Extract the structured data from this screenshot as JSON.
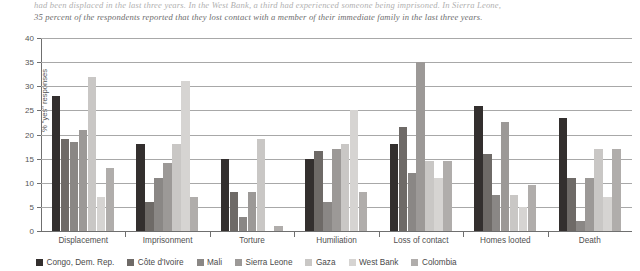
{
  "caption": {
    "line1": "had been displaced in the last three years. In the West Bank, a third had experienced someone being imprisoned. In Sierra Leone,",
    "line2": "35 percent of the respondents reported that they lost contact with a member of their immediate family in the last three years."
  },
  "chart_data": {
    "type": "bar",
    "title": "",
    "xlabel": "",
    "ylabel": "% \"yes\" responses",
    "ylim": [
      0,
      40
    ],
    "yticks": [
      0,
      5,
      10,
      15,
      20,
      25,
      30,
      35,
      40
    ],
    "grid": true,
    "legend_position": "bottom",
    "categories": [
      "Displacement",
      "Imprisonment",
      "Torture",
      "Humiliation",
      "Loss of contact",
      "Homes looted",
      "Death"
    ],
    "series": [
      {
        "name": "Congo, Dem. Rep.",
        "color": "#332f2e",
        "values": [
          28,
          18,
          15,
          15,
          18,
          26,
          23.5
        ]
      },
      {
        "name": "Côte d'Ivoire",
        "color": "#6e6a67",
        "values": [
          19,
          6,
          8,
          16.5,
          21.5,
          16,
          11
        ]
      },
      {
        "name": "Mali",
        "color": "#8a8785",
        "values": [
          18.5,
          11,
          3,
          6,
          12,
          7.5,
          2
        ]
      },
      {
        "name": "Sierra Leone",
        "color": "#9c9997",
        "values": [
          21,
          14,
          8,
          17,
          35,
          22.5,
          11
        ]
      },
      {
        "name": "Gaza",
        "color": "#c9c7c5",
        "values": [
          32,
          18,
          19,
          18,
          14.5,
          7.5,
          17
        ]
      },
      {
        "name": "West Bank",
        "color": "#d6d4d2",
        "values": [
          7,
          31,
          0,
          25,
          11,
          5,
          7
        ]
      },
      {
        "name": "Colombia",
        "color": "#b0adab",
        "values": [
          13,
          7,
          1,
          8,
          14.5,
          9.5,
          17
        ]
      }
    ]
  }
}
